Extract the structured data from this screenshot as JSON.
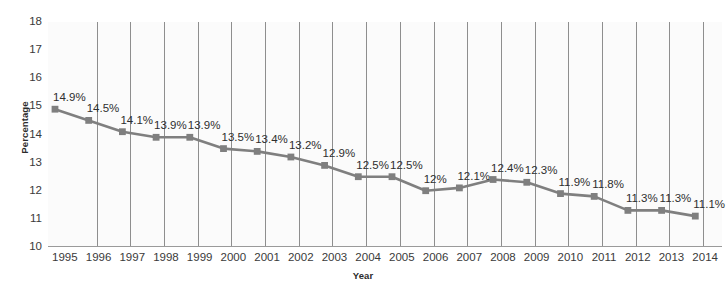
{
  "chart_data": {
    "type": "line",
    "title": "",
    "xlabel": "Year",
    "ylabel": "Percentage",
    "ylim": [
      10,
      18
    ],
    "yticks": [
      18,
      17,
      16,
      15,
      14,
      13,
      12,
      11,
      10
    ],
    "grid": "vertical",
    "legend": "none",
    "series_color": "#7f7f7f",
    "marker": "square",
    "categories": [
      "1995",
      "1996",
      "1997",
      "1998",
      "1999",
      "2000",
      "2001",
      "2002",
      "2003",
      "2004",
      "2005",
      "2006",
      "2007",
      "2008",
      "2009",
      "2010",
      "2011",
      "2012",
      "2013",
      "2014"
    ],
    "values": [
      14.9,
      14.5,
      14.1,
      13.9,
      13.9,
      13.5,
      13.4,
      13.2,
      12.9,
      12.5,
      12.5,
      12.0,
      12.1,
      12.4,
      12.3,
      11.9,
      11.8,
      11.3,
      11.3,
      11.1
    ],
    "data_labels": [
      "14.9%",
      "14.5%",
      "14.1%",
      "13.9%",
      "13.9%",
      "13.5%",
      "13.4%",
      "13.2%",
      "12.9%",
      "12.5%",
      "12.5%",
      "12%",
      "12.1%",
      "12.4%",
      "12.3%",
      "11.9%",
      "11.8%",
      "11.3%",
      "11.3%",
      "11.1%"
    ]
  },
  "colors": {
    "series": "#7f7f7f",
    "gridline": "#8e8e8e",
    "axis": "#9a9a9a",
    "plot_background": "#fbfbfb",
    "text": "#3a3a3a"
  }
}
